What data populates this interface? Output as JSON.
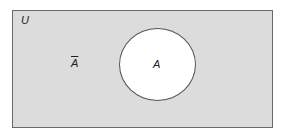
{
  "diagram": {
    "type": "venn",
    "universe_label": "U",
    "set_label": "A",
    "complement_label": "A",
    "complement_note": "overbar",
    "colors": {
      "universe_fill": "#dcdcdc",
      "set_fill": "#ffffff"
    }
  }
}
